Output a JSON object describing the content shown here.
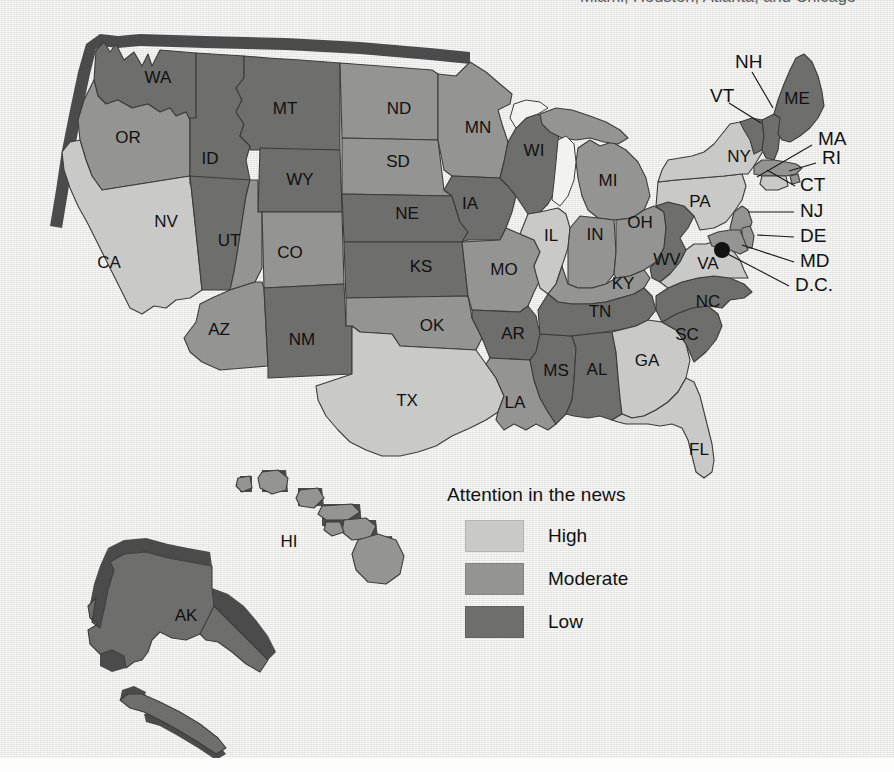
{
  "caption": {
    "top_partial_text": "Miami, Houston, Atlanta, and Chicago"
  },
  "legend": {
    "title": "Attention in the news",
    "items": [
      {
        "label": "High",
        "color": "#c9c9c7"
      },
      {
        "label": "Moderate",
        "color": "#949492"
      },
      {
        "label": "Low",
        "color": "#6e6e6c"
      }
    ]
  },
  "colors": {
    "high": "#c9c9c7",
    "moderate": "#949492",
    "low": "#6e6e6c",
    "shadow": "#4b4b4b",
    "background": "#e9e9e7",
    "border": "#3c3c3c",
    "dc_dot": "#121212"
  },
  "map": {
    "type": "choropleth",
    "region": "United States",
    "measure": "Attention in the news",
    "dc_marker": "D.C.",
    "states": [
      {
        "code": "WA",
        "level": "Low",
        "label_x": 158,
        "label_y": 79
      },
      {
        "code": "OR",
        "level": "Moderate",
        "label_x": 128,
        "label_y": 139
      },
      {
        "code": "CA",
        "level": "High",
        "label_x": 109,
        "label_y": 264
      },
      {
        "code": "NV",
        "level": "Low",
        "label_x": 166,
        "label_y": 223
      },
      {
        "code": "ID",
        "level": "Low",
        "label_x": 210,
        "label_y": 160
      },
      {
        "code": "MT",
        "level": "Low",
        "label_x": 285,
        "label_y": 110
      },
      {
        "code": "WY",
        "level": "Low",
        "label_x": 300,
        "label_y": 181
      },
      {
        "code": "UT",
        "level": "Moderate",
        "label_x": 229,
        "label_y": 242
      },
      {
        "code": "AZ",
        "level": "Moderate",
        "label_x": 219,
        "label_y": 331
      },
      {
        "code": "CO",
        "level": "Moderate",
        "label_x": 290,
        "label_y": 254
      },
      {
        "code": "NM",
        "level": "Low",
        "label_x": 302,
        "label_y": 341
      },
      {
        "code": "ND",
        "level": "Moderate",
        "label_x": 399,
        "label_y": 110
      },
      {
        "code": "SD",
        "level": "Moderate",
        "label_x": 398,
        "label_y": 163
      },
      {
        "code": "NE",
        "level": "Low",
        "label_x": 407,
        "label_y": 215
      },
      {
        "code": "KS",
        "level": "Low",
        "label_x": 421,
        "label_y": 268
      },
      {
        "code": "OK",
        "level": "Moderate",
        "label_x": 432,
        "label_y": 327
      },
      {
        "code": "TX",
        "level": "High",
        "label_x": 407,
        "label_y": 402
      },
      {
        "code": "MN",
        "level": "Moderate",
        "label_x": 478,
        "label_y": 129
      },
      {
        "code": "IA",
        "level": "Low",
        "label_x": 470,
        "label_y": 205
      },
      {
        "code": "MO",
        "level": "Moderate",
        "label_x": 504,
        "label_y": 271
      },
      {
        "code": "AR",
        "level": "Low",
        "label_x": 513,
        "label_y": 335
      },
      {
        "code": "LA",
        "level": "Moderate",
        "label_x": 515,
        "label_y": 404
      },
      {
        "code": "WI",
        "level": "Low",
        "label_x": 534,
        "label_y": 152
      },
      {
        "code": "IL",
        "level": "High",
        "label_x": 551,
        "label_y": 237
      },
      {
        "code": "MS",
        "level": "Low",
        "label_x": 556,
        "label_y": 372
      },
      {
        "code": "MI",
        "level": "Moderate",
        "label_x": 608,
        "label_y": 182
      },
      {
        "code": "IN",
        "level": "Moderate",
        "label_x": 595,
        "label_y": 236
      },
      {
        "code": "KY",
        "level": "Moderate",
        "label_x": 623,
        "label_y": 285
      },
      {
        "code": "TN",
        "level": "Low",
        "label_x": 600,
        "label_y": 313
      },
      {
        "code": "AL",
        "level": "Low",
        "label_x": 597,
        "label_y": 371
      },
      {
        "code": "OH",
        "level": "Moderate",
        "label_x": 640,
        "label_y": 224
      },
      {
        "code": "WV",
        "level": "Low",
        "label_x": 667,
        "label_y": 261
      },
      {
        "code": "GA",
        "level": "High",
        "label_x": 647,
        "label_y": 362
      },
      {
        "code": "SC",
        "level": "Low",
        "label_x": 687,
        "label_y": 336
      },
      {
        "code": "NC",
        "level": "Low",
        "label_x": 708,
        "label_y": 303
      },
      {
        "code": "FL",
        "level": "High",
        "label_x": 699,
        "label_y": 451
      },
      {
        "code": "VA",
        "level": "High",
        "label_x": 708,
        "label_y": 265
      },
      {
        "code": "PA",
        "level": "High",
        "label_x": 700,
        "label_y": 203
      },
      {
        "code": "NY",
        "level": "High",
        "label_x": 739,
        "label_y": 158
      },
      {
        "code": "ME",
        "level": "Low",
        "label_x": 797,
        "label_y": 100
      },
      {
        "code": "HI",
        "level": "Moderate",
        "label_x": 289,
        "label_y": 543
      },
      {
        "code": "AK",
        "level": "Low",
        "label_x": 186,
        "label_y": 617
      }
    ],
    "callouts": [
      {
        "code": "NH",
        "level": "Low",
        "label_x": 735,
        "label_y": 63,
        "line": "752,72 773,108"
      },
      {
        "code": "VT",
        "level": "Low",
        "label_x": 710,
        "label_y": 97,
        "line": "729,103 761,123"
      },
      {
        "code": "MA",
        "level": "Moderate",
        "label_x": 818,
        "label_y": 140,
        "line": "812,145 757,177"
      },
      {
        "code": "RI",
        "level": "Moderate",
        "label_x": 822,
        "label_y": 159,
        "line": "816,163 789,171"
      },
      {
        "code": "CT",
        "level": "High",
        "label_x": 800,
        "label_y": 186,
        "line": "795,186 767,170"
      },
      {
        "code": "NJ",
        "level": "Moderate",
        "label_x": 800,
        "label_y": 212,
        "line": "794,212 748,212"
      },
      {
        "code": "DE",
        "level": "Moderate",
        "label_x": 800,
        "label_y": 237,
        "line": "794,237 757,235"
      },
      {
        "code": "MD",
        "level": "Moderate",
        "label_x": 800,
        "label_y": 262,
        "line": "794,262 742,245"
      },
      {
        "code": "D.C.",
        "level": "marker",
        "label_x": 795,
        "label_y": 286,
        "line": "789,286 722,251"
      }
    ]
  }
}
